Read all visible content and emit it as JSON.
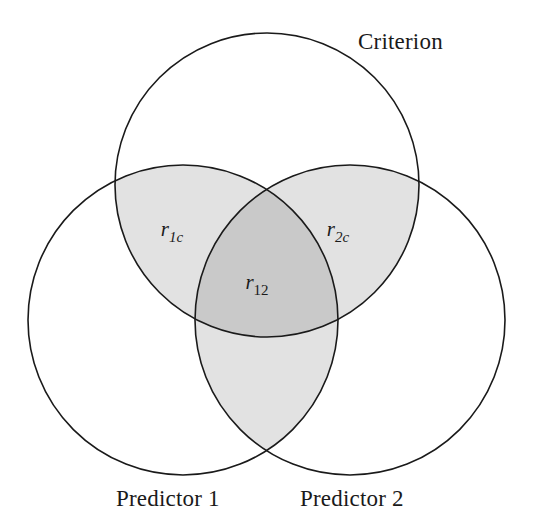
{
  "figure": {
    "type": "venn-diagram",
    "background_color": "#ffffff",
    "stroke_color": "#1a1a1a",
    "stroke_width": 1.6
  },
  "sets": {
    "criterion": {
      "label": "Criterion",
      "name": "criterion-circle",
      "cx": 267,
      "cy": 185,
      "r": 152,
      "fill": "none"
    },
    "predictor_1": {
      "label": "Predictor 1",
      "name": "predictor-1-circle",
      "cx": 183,
      "cy": 320,
      "r": 155,
      "fill": "none"
    },
    "predictor_2": {
      "label": "Predictor 2",
      "name": "predictor-2-circle",
      "cx": 350,
      "cy": 320,
      "r": 155,
      "fill": "none"
    }
  },
  "regions": [
    {
      "id": "r1c",
      "name": "region-r1c",
      "label_var": "r",
      "label_sub": "1c",
      "sub_style": "italic",
      "description": "Criterion overlap with Predictor 1",
      "fill": "#e2e2e2",
      "label_x": 172,
      "label_y": 236
    },
    {
      "id": "r2c",
      "name": "region-r2c",
      "label_var": "r",
      "label_sub": "2c",
      "sub_style": "italic",
      "description": "Criterion overlap with Predictor 2",
      "fill": "#e2e2e2",
      "label_x": 338,
      "label_y": 236
    },
    {
      "id": "r12",
      "name": "region-r12",
      "label_var": "r",
      "label_sub": "12",
      "sub_style": "roman",
      "description": "Predictor 1 overlap with Predictor 2",
      "fill": "#c9c9c9",
      "label_x": 257,
      "label_y": 289
    },
    {
      "id": "p12-lower",
      "name": "region-predictor-overlap-lower",
      "label_var": "",
      "label_sub": "",
      "sub_style": "none",
      "description": "Predictor 1 and Predictor 2 overlap outside Criterion",
      "fill": "#e2e2e2",
      "label_x": 0,
      "label_y": 0
    }
  ],
  "colors": {
    "light_shade": "#e2e2e2",
    "dark_shade": "#c9c9c9",
    "outline": "#1a1a1a",
    "text": "#1a1a1a"
  }
}
